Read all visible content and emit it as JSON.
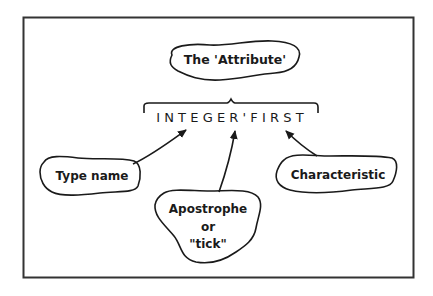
{
  "diagram": {
    "frame": {
      "stroke": "#333333"
    },
    "ink_color": "#1a1a1a",
    "expression": "INTEGER'FIRST",
    "labels": {
      "attribute": "The 'Attribute'",
      "type_name": "Type name",
      "apostrophe_line1": "Apostrophe",
      "apostrophe_line2": "or",
      "apostrophe_line3": "\"tick\"",
      "characteristic": "Characteristic"
    }
  }
}
